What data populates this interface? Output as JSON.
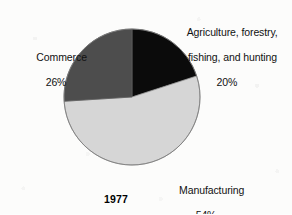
{
  "chart_data": {
    "type": "pie",
    "title": "",
    "year_label": "1977",
    "categories": [
      "Agriculture, forestry, fishing, and hunting",
      "Manufacturing",
      "Commerce"
    ],
    "values": [
      20,
      54,
      26
    ],
    "value_labels": [
      "20%",
      "54%",
      "26%"
    ],
    "units": "percent",
    "start_angle_deg": 0,
    "direction": "clockwise",
    "legend": "none (direct labels)",
    "slices": [
      {
        "name": "Agriculture, forestry, fishing, and hunting",
        "label_line1": "Agriculture, forestry,",
        "label_line2": "fishing, and hunting",
        "value": 20,
        "value_label": "20%",
        "color": "#0b0b0b",
        "start_deg": 0,
        "end_deg": 72
      },
      {
        "name": "Manufacturing",
        "label_line1": "Manufacturing",
        "label_line2": "",
        "value": 54,
        "value_label": "54%",
        "color": "#d6d6d6",
        "start_deg": 72,
        "end_deg": 266.4
      },
      {
        "name": "Commerce",
        "label_line1": "Commerce",
        "label_line2": "",
        "value": 26,
        "value_label": "26%",
        "color": "#4d4d4d",
        "start_deg": 266.4,
        "end_deg": 360
      }
    ]
  },
  "colors": {
    "background": "#fcfcfb",
    "agriculture": "#0b0b0b",
    "manufacturing": "#d6d6d6",
    "commerce": "#4d4d4d",
    "outline": "#6f6f6f",
    "text": "#111111"
  },
  "labels": {
    "agriculture_line1": "Agriculture, forestry,",
    "agriculture_line2": "fishing, and hunting",
    "agriculture_pct": "20%",
    "commerce_name": "Commerce",
    "commerce_pct": "26%",
    "manufacturing_name": "Manufacturing",
    "manufacturing_pct": "54%",
    "year": "1977"
  }
}
